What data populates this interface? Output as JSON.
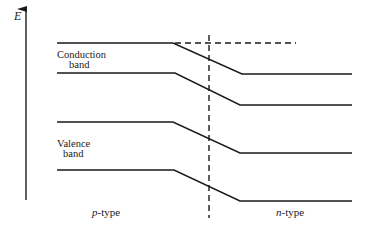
{
  "diagram": {
    "axis": {
      "label": "E",
      "x": 26,
      "y_top": 8,
      "y_bottom": 200
    },
    "labels": {
      "conduction_line1": "Conduction",
      "conduction_line2": "band",
      "valence_line1": "Valence",
      "valence_line2": "band",
      "p_type_italic": "p",
      "p_type_rest": "-type",
      "n_type_italic": "n",
      "n_type_rest": "-type"
    },
    "bands": [
      {
        "name": "conduction-band-top",
        "points": "57,43 173,43 242,74 352,74"
      },
      {
        "name": "conduction-band-bottom",
        "points": "57,73 175,73 240,105 352,105"
      },
      {
        "name": "valence-band-top",
        "points": "57,122 173,122 240,153 352,153"
      },
      {
        "name": "valence-band-bottom",
        "points": "57,170 174,170 240,201 352,201"
      }
    ],
    "dashed_lines": {
      "fermi_level": {
        "x1": 175,
        "y1": 43,
        "x2": 296,
        "y2": 43
      },
      "junction": {
        "x1": 209,
        "y1": 35,
        "x2": 209,
        "y2": 218
      }
    },
    "colors": {
      "line": "#1a1a1a",
      "background": "#ffffff"
    }
  }
}
